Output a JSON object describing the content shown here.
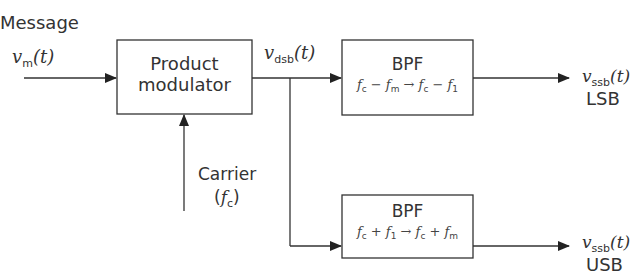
{
  "diagram": {
    "input": {
      "label": "Message",
      "signal_symbol": "v",
      "signal_sub": "m",
      "signal_arg": "(t)"
    },
    "modulator": {
      "line1": "Product",
      "line2": "modulator"
    },
    "carrier": {
      "label": "Carrier",
      "symbol_open": "(",
      "symbol": "f",
      "symbol_sub": "c",
      "symbol_close": ")"
    },
    "dsb": {
      "symbol": "v",
      "sub": "dsb",
      "arg": "(t)"
    },
    "filters": [
      {
        "name": "BPF",
        "formula": {
          "a": "f",
          "a_sub": "c",
          "op1": " − ",
          "b": "f",
          "b_sub": "m",
          "arrow": " → ",
          "c": "f",
          "c_sub": "c",
          "op2": " − ",
          "d": "f",
          "d_sub": "1"
        },
        "output": {
          "symbol": "v",
          "sub": "ssb",
          "arg": "(t)",
          "band": "LSB"
        }
      },
      {
        "name": "BPF",
        "formula": {
          "a": "f",
          "a_sub": "c",
          "op1": " + ",
          "b": "f",
          "b_sub": "1",
          "arrow": " → ",
          "c": "f",
          "c_sub": "c",
          "op2": " + ",
          "d": "f",
          "d_sub": "m"
        },
        "output": {
          "symbol": "v",
          "sub": "ssb",
          "arg": "(t)",
          "band": "USB"
        }
      }
    ],
    "colors": {
      "line": "#333333",
      "text": "#333333",
      "background": "#ffffff"
    }
  }
}
